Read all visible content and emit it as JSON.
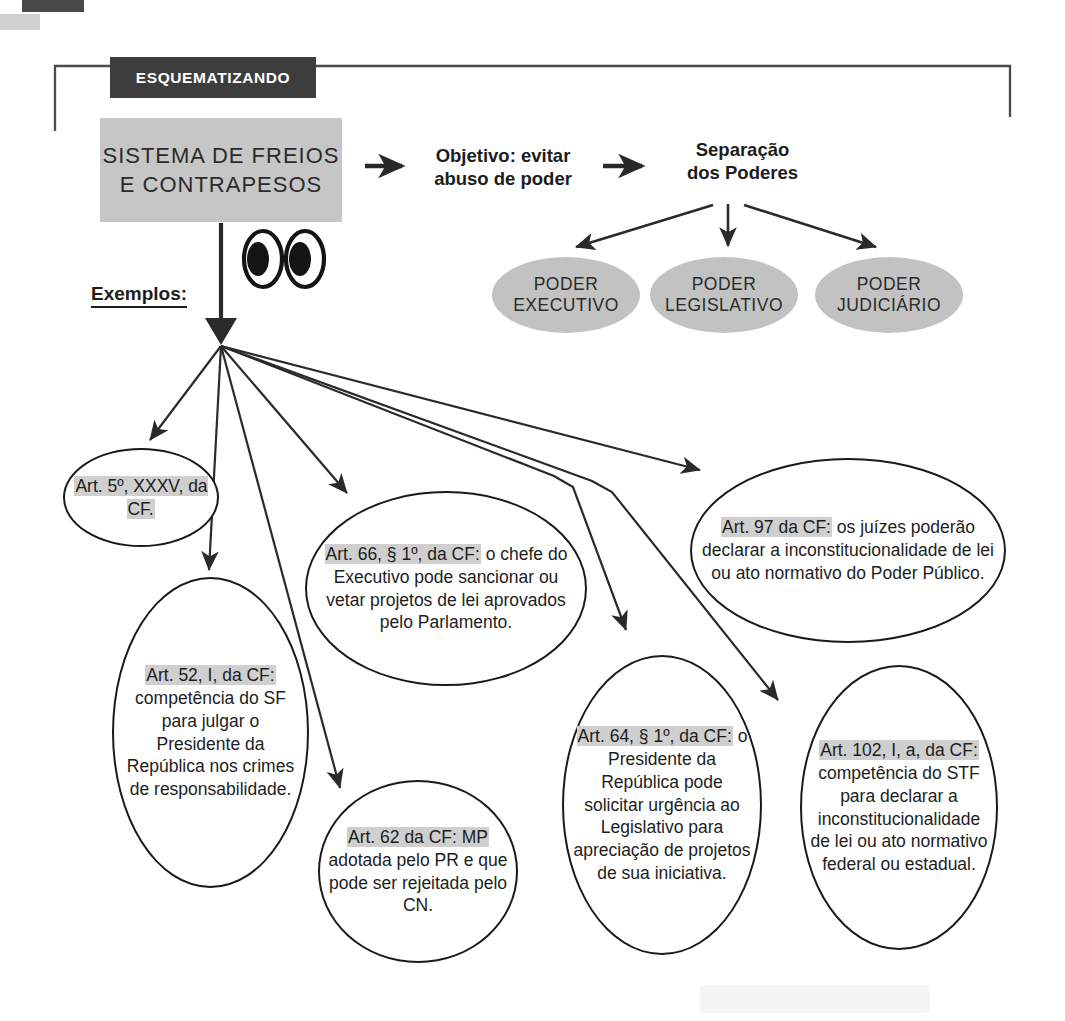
{
  "page": {
    "header_band": "ESQUEMATIZANDO",
    "title_line_1": "SISTEMA DE FREIOS",
    "title_line_2": "E CONTRAPESOS",
    "examples_label": "Exemplos:"
  },
  "flow": {
    "objective_line_1": "Objetivo: evitar",
    "objective_line_2": "abuso de poder",
    "separation_line_1": "Separação",
    "separation_line_2": "dos Poderes"
  },
  "powers": [
    {
      "line_1": "PODER",
      "line_2": "EXECUTIVO"
    },
    {
      "line_1": "PODER",
      "line_2": "LEGISLATIVO"
    },
    {
      "line_1": "PODER",
      "line_2": "JUDICIÁRIO"
    }
  ],
  "examples": [
    {
      "id": "art-5",
      "highlight": "Art. 5º, XXXV, da CF.",
      "rest": "",
      "full_text": "Art. 5º, XXXV, da CF."
    },
    {
      "id": "art-52",
      "highlight": "Art. 52, I, da CF:",
      "rest": " competência do SF para julgar o Presidente da República nos crimes de responsabilidade.",
      "full_text": "Art. 52, I, da CF: competência do SF para julgar o Presidente da República nos crimes de responsabilidade."
    },
    {
      "id": "art-66",
      "highlight": "Art. 66, § 1º, da CF:",
      "rest": " o chefe do Executivo pode sancionar ou vetar projetos de lei aprovados pelo Parlamento.",
      "full_text": "Art. 66, § 1º, da CF: o chefe do Executivo pode sancionar ou vetar projetos de lei aprovados pelo Parlamento."
    },
    {
      "id": "art-62",
      "highlight": "Art. 62 da CF: MP",
      "rest": " adotada pelo PR e que pode ser rejeitada pelo CN.",
      "full_text": "Art. 62 da CF: MP adotada pelo PR e que pode ser rejeitada pelo CN."
    },
    {
      "id": "art-64",
      "highlight": "Art. 64, § 1º, da CF:",
      "rest": " o Presidente da República pode solicitar urgência ao Legislativo para apreciação de projetos de sua iniciativa.",
      "full_text": "Art. 64, § 1º, da CF: o Presidente da República pode solicitar urgência ao Legislativo para apreciação de projetos de sua iniciativa."
    },
    {
      "id": "art-97",
      "highlight": "Art. 97 da CF:",
      "rest": " os juízes poderão declarar a inconstitucionalidade de lei ou ato normativo do Poder Público.",
      "full_text": "Art. 97 da CF: os juízes poderão declarar a inconstitucionalidade de lei ou ato normativo do Poder Público."
    },
    {
      "id": "art-102",
      "highlight": "Art. 102, I, a, da CF:",
      "rest": " competência do STF para declarar a inconstitucionalidade de lei ou ato normativo federal ou estadual.",
      "full_text": "Art. 102, I, a, da CF: competência do STF para declarar a inconstitucionalidade de lei ou ato normativo federal ou estadual."
    }
  ],
  "colors": {
    "band_background": "#3d3d3d",
    "band_text": "#ffffff",
    "title_background": "#c6c6c6",
    "power_fill": "#c2c2c2",
    "highlight": "#cfcfcf",
    "ink": "#1a1a1a",
    "page_background": "#ffffff"
  }
}
